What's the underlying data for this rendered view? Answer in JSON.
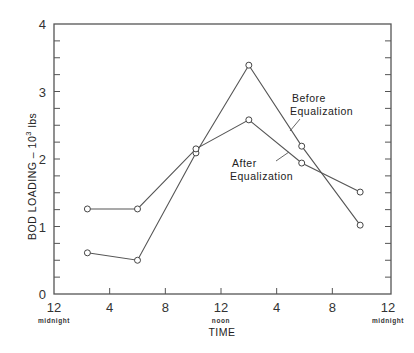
{
  "chart_data": {
    "type": "line",
    "title": "",
    "xlabel": "TIME",
    "ylabel": "BOD  LOADING – 10³ lbs",
    "ylabel_parts": {
      "main": "BOD  LOADING – 10",
      "sup": "3",
      "unit": " lbs"
    },
    "xlim": [
      0,
      24
    ],
    "ylim": [
      0,
      4
    ],
    "grid": false,
    "x_ticks": [
      {
        "value": 0,
        "label": "12",
        "sublabel": "midnight"
      },
      {
        "value": 4,
        "label": "4",
        "sublabel": ""
      },
      {
        "value": 8,
        "label": "8",
        "sublabel": ""
      },
      {
        "value": 12,
        "label": "12",
        "sublabel": "noon"
      },
      {
        "value": 16,
        "label": "4",
        "sublabel": ""
      },
      {
        "value": 20,
        "label": "8",
        "sublabel": ""
      },
      {
        "value": 24,
        "label": "12",
        "sublabel": "midnight"
      }
    ],
    "y_ticks": [
      {
        "value": 0,
        "label": "0"
      },
      {
        "value": 1,
        "label": "1"
      },
      {
        "value": 2,
        "label": "2"
      },
      {
        "value": 3,
        "label": "3"
      },
      {
        "value": 4,
        "label": "4"
      }
    ],
    "series": [
      {
        "name": "Before Equalization",
        "x": [
          2.4,
          6.0,
          10.2,
          14.0,
          17.8,
          22.0
        ],
        "values": [
          0.61,
          0.5,
          2.09,
          3.39,
          2.19,
          1.02
        ]
      },
      {
        "name": "After Equalization",
        "x": [
          2.4,
          6.0,
          10.2,
          14.0,
          17.8,
          22.0
        ],
        "values": [
          1.26,
          1.26,
          2.15,
          2.58,
          1.94,
          1.51
        ]
      }
    ],
    "annotations": [
      {
        "lines": [
          "Before",
          "Equalization"
        ],
        "series": "Before Equalization"
      },
      {
        "lines": [
          "After",
          "Equalization"
        ],
        "series": "After Equalization"
      }
    ],
    "marker": "open-circle",
    "legend": "none (inline annotations)"
  }
}
